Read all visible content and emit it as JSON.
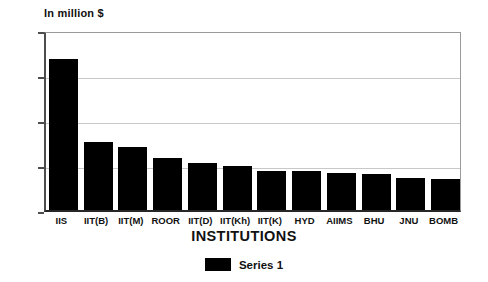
{
  "chart_data": {
    "type": "bar",
    "title": "",
    "xlabel": "INSTITUTIONS",
    "ylabel": "In million $",
    "categories": [
      "IIS",
      "IIT(B)",
      "IIT(M)",
      "ROOR",
      "IIT(D)",
      "IIT(Kh)",
      "IIT(K)",
      "HYD",
      "AIIMS",
      "BHU",
      "JNU",
      "BOMB"
    ],
    "values": [
      1.68,
      0.76,
      0.7,
      0.58,
      0.52,
      0.49,
      0.43,
      0.43,
      0.41,
      0.4,
      0.36,
      0.35
    ],
    "series": [
      {
        "name": "Series 1",
        "color": "#000000",
        "values": [
          1.68,
          0.76,
          0.7,
          0.58,
          0.52,
          0.49,
          0.43,
          0.43,
          0.41,
          0.4,
          0.36,
          0.35
        ]
      }
    ],
    "ylim": [
      0,
      2
    ],
    "yticks": [
      0,
      0.5,
      1,
      1.5,
      2
    ],
    "ytick_labels": [
      "0",
      "0.5",
      "1",
      "1.5",
      "2"
    ],
    "grid": true,
    "grid_axis": "y",
    "legend": {
      "position": "bottom",
      "entries": [
        {
          "label": "Series 1",
          "color": "#000000"
        }
      ]
    },
    "colors": {
      "bar": "#000000",
      "grid": "#c8c8c8",
      "axis": "#4d4d4d",
      "text": "#111111",
      "background": "#ffffff"
    }
  }
}
